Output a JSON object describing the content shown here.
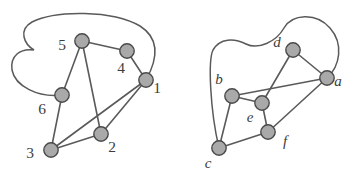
{
  "figure": {
    "background_color": "#ffffff",
    "node_fill": "#a9a9a9",
    "node_stroke": "#4a4a4a",
    "edge_color": "#5a5a5a",
    "label_color": "#3d3d3d",
    "width": 347,
    "height": 175
  },
  "graphs": [
    {
      "id": "left-graph",
      "name": "numbered-graph",
      "vertices": [
        {
          "id": "v1",
          "label": "1",
          "x": 146,
          "y": 80,
          "label_x": 157,
          "label_y": 93
        },
        {
          "id": "v2",
          "label": "2",
          "x": 101,
          "y": 134,
          "label_x": 112,
          "label_y": 152
        },
        {
          "id": "v3",
          "label": "3",
          "x": 51,
          "y": 150,
          "label_x": 30,
          "label_y": 158
        },
        {
          "id": "v4",
          "label": "4",
          "x": 127,
          "y": 51,
          "label_x": 121,
          "label_y": 73
        },
        {
          "id": "v5",
          "label": "5",
          "x": 82,
          "y": 41,
          "label_x": 62,
          "label_y": 50
        },
        {
          "id": "v6",
          "label": "6",
          "x": 62,
          "y": 95,
          "label_x": 42,
          "label_y": 114
        }
      ],
      "edges": [
        {
          "from": "v5",
          "to": "v4",
          "type": "straight"
        },
        {
          "from": "v4",
          "to": "v1",
          "type": "straight"
        },
        {
          "from": "v5",
          "to": "v6",
          "type": "straight"
        },
        {
          "from": "v5",
          "to": "v2",
          "type": "straight"
        },
        {
          "from": "v6",
          "to": "v3",
          "type": "straight"
        },
        {
          "from": "v3",
          "to": "v2",
          "type": "straight"
        },
        {
          "from": "v3",
          "to": "v1",
          "type": "straight"
        },
        {
          "from": "v2",
          "to": "v1",
          "type": "straight"
        },
        {
          "from": "v1",
          "to": "v6",
          "type": "curve-outer-left"
        }
      ]
    },
    {
      "id": "right-graph",
      "name": "lettered-graph",
      "vertices": [
        {
          "id": "va",
          "label": "a",
          "x": 327,
          "y": 78,
          "label_x": 336,
          "label_y": 86
        },
        {
          "id": "vb",
          "label": "b",
          "x": 232,
          "y": 96,
          "label_x": 219,
          "label_y": 84
        },
        {
          "id": "vc",
          "label": "c",
          "x": 219,
          "y": 148,
          "label_x": 208,
          "label_y": 168
        },
        {
          "id": "vd",
          "label": "d",
          "x": 293,
          "y": 50,
          "label_x": 277,
          "label_y": 47
        },
        {
          "id": "ve",
          "label": "e",
          "x": 262,
          "y": 103,
          "label_x": 250,
          "label_y": 122
        },
        {
          "id": "vf",
          "label": "f",
          "x": 268,
          "y": 132,
          "label_x": 283,
          "label_y": 146
        }
      ],
      "edges": [
        {
          "from": "vd",
          "to": "va",
          "type": "straight"
        },
        {
          "from": "vd",
          "to": "ve",
          "type": "straight"
        },
        {
          "from": "vb",
          "to": "va",
          "type": "straight"
        },
        {
          "from": "vb",
          "to": "ve",
          "type": "straight"
        },
        {
          "from": "vb",
          "to": "vc",
          "type": "straight"
        },
        {
          "from": "ve",
          "to": "vf",
          "type": "straight"
        },
        {
          "from": "vf",
          "to": "va",
          "type": "straight"
        },
        {
          "from": "vf",
          "to": "vc",
          "type": "straight"
        },
        {
          "from": "va",
          "to": "vc",
          "type": "curve-outer-top"
        }
      ]
    }
  ]
}
